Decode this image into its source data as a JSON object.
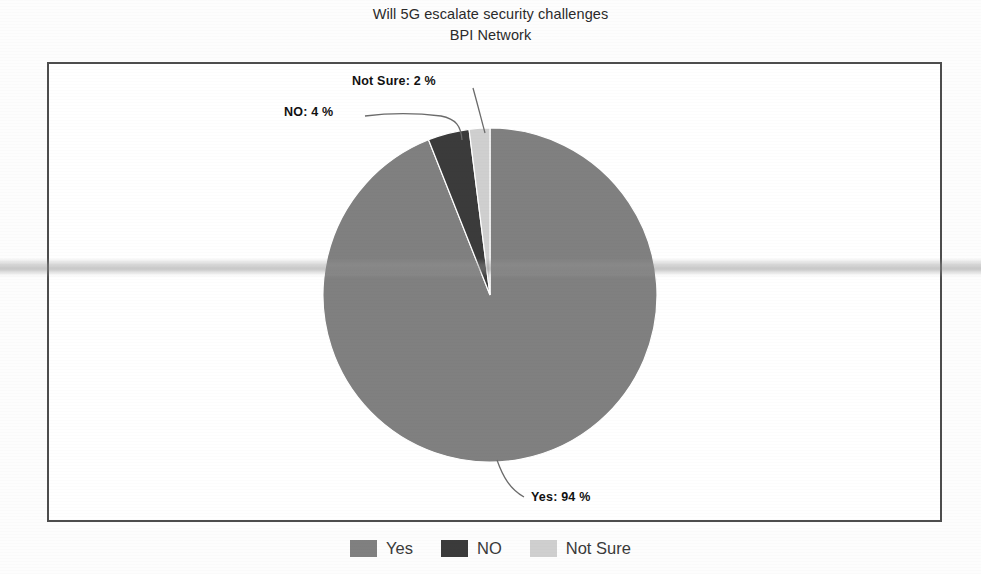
{
  "chart_data": {
    "type": "pie",
    "title": "Will 5G escalate security challenges",
    "subtitle": "BPI Network",
    "categories": [
      "Yes",
      "NO",
      "Not Sure"
    ],
    "values": [
      94,
      4,
      2
    ],
    "unit": "%",
    "labels": [
      {
        "key": "yes",
        "text": "Yes: 94 %",
        "category": "Yes",
        "value": 94
      },
      {
        "key": "no",
        "text": "NO: 4 %",
        "category": "NO",
        "value": 4
      },
      {
        "key": "not_sure",
        "text": "Not Sure: 2 %",
        "category": "Not Sure",
        "value": 2
      }
    ],
    "colors": {
      "yes": "#808080",
      "no": "#3b3b3b",
      "not_sure": "#cfcfcf"
    },
    "legend_position": "bottom",
    "grid": false,
    "xlabel": "",
    "ylabel": ""
  },
  "header": {
    "title": "Will 5G escalate security challenges",
    "subtitle": "BPI Network"
  },
  "plot": {
    "labels": {
      "not_sure": "Not Sure: 2 %",
      "no": "NO: 4 %",
      "yes": "Yes: 94 %"
    }
  },
  "legend": {
    "items": [
      {
        "label": "Yes",
        "color": "#808080"
      },
      {
        "label": "NO",
        "color": "#3b3b3b"
      },
      {
        "label": "Not Sure",
        "color": "#cfcfcf"
      }
    ]
  }
}
